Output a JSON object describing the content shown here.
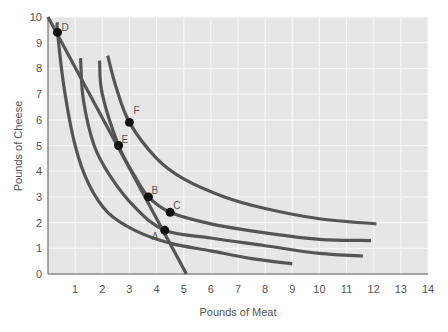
{
  "chart_data": {
    "type": "line",
    "title": "",
    "xlabel": "Pounds of Meat",
    "ylabel": "Pounds of Cheese",
    "xlim": [
      0,
      14
    ],
    "ylim": [
      0,
      10
    ],
    "x_ticks": [
      "1",
      "2",
      "3",
      "4",
      "5",
      "6",
      "7",
      "8",
      "9",
      "10",
      "11",
      "12",
      "13",
      "14"
    ],
    "y_ticks": [
      "0",
      "1",
      "2",
      "3",
      "4",
      "5",
      "6",
      "7",
      "8",
      "9",
      "10"
    ],
    "grid": true,
    "legend": null,
    "series": [
      {
        "name": "Budget line",
        "points": [
          [
            0,
            10
          ],
          [
            5.1,
            0
          ]
        ]
      },
      {
        "name": "Indifference curve through D",
        "points": [
          [
            0.35,
            9.8
          ],
          [
            0.35,
            9.4
          ],
          [
            0.6,
            7.2
          ],
          [
            1.0,
            5.0
          ],
          [
            1.5,
            3.5
          ],
          [
            2.2,
            2.4
          ],
          [
            3.2,
            1.7
          ],
          [
            4.5,
            1.2
          ],
          [
            6.0,
            0.9
          ],
          [
            7.5,
            0.6
          ],
          [
            9.0,
            0.4
          ]
        ]
      },
      {
        "name": "Indifference curve through A",
        "points": [
          [
            1.2,
            8.4
          ],
          [
            1.3,
            6.8
          ],
          [
            1.7,
            5.0
          ],
          [
            2.3,
            3.8
          ],
          [
            3.2,
            2.6
          ],
          [
            4.3,
            1.7
          ],
          [
            6.0,
            1.4
          ],
          [
            8.0,
            1.1
          ],
          [
            10.0,
            0.8
          ],
          [
            11.6,
            0.7
          ]
        ]
      },
      {
        "name": "Indifference curve through E, B, C",
        "points": [
          [
            1.9,
            8.3
          ],
          [
            2.0,
            7.0
          ],
          [
            2.6,
            5.0
          ],
          [
            3.2,
            3.8
          ],
          [
            3.7,
            3.0
          ],
          [
            4.5,
            2.4
          ],
          [
            6.0,
            1.95
          ],
          [
            8.0,
            1.6
          ],
          [
            10.0,
            1.35
          ],
          [
            11.9,
            1.3
          ]
        ]
      },
      {
        "name": "Indifference curve through F",
        "points": [
          [
            2.2,
            8.5
          ],
          [
            2.5,
            7.3
          ],
          [
            3.0,
            5.9
          ],
          [
            4.0,
            4.5
          ],
          [
            5.0,
            3.7
          ],
          [
            6.5,
            3.0
          ],
          [
            8.0,
            2.55
          ],
          [
            10.0,
            2.15
          ],
          [
            12.1,
            1.95
          ]
        ]
      }
    ],
    "annotations": [
      {
        "label": "A",
        "x": 4.3,
        "y": 1.7
      },
      {
        "label": "B",
        "x": 3.7,
        "y": 3.0
      },
      {
        "label": "C",
        "x": 4.5,
        "y": 2.4
      },
      {
        "label": "D",
        "x": 0.35,
        "y": 9.4
      },
      {
        "label": "E",
        "x": 2.6,
        "y": 5.0
      },
      {
        "label": "F",
        "x": 3.0,
        "y": 5.9
      }
    ]
  },
  "colors": {
    "plot_bg": "#e6e6e6",
    "grid": "#f7f7f7",
    "curve": "#555555",
    "axis": "#8a8a8a",
    "point": "#111111"
  }
}
